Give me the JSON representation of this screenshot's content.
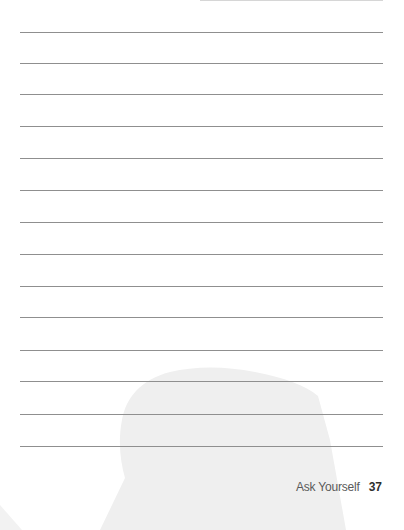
{
  "page": {
    "background": "#ffffff",
    "rule_color": "#8f8f8f",
    "silhouette_color": "#efefef",
    "ruled_line_count": 15,
    "ruled_lines_y": [
      0,
      32,
      63,
      94,
      126,
      158,
      190,
      222,
      254,
      286,
      317,
      350,
      381,
      414,
      446
    ]
  },
  "footer": {
    "section_title": "Ask Yourself",
    "page_number": "37"
  }
}
